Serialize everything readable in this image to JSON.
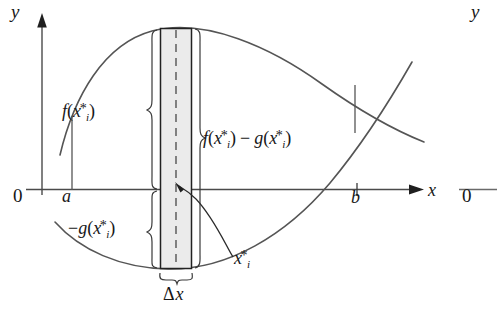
{
  "figure": {
    "colors": {
      "ink": "#1a1a1a",
      "curve": "#555555",
      "axis": "#4a4a4a",
      "rect_fill": "#ebebeb",
      "rect_stroke": "#222222",
      "brace": "#3a3a3a",
      "background": "#ffffff"
    },
    "main_plot": {
      "y_axis_label": "y",
      "x_axis_label": "x",
      "origin_label": "0",
      "left_bound_label": "a",
      "right_bound_label": "b",
      "axis_arrows": [
        "up",
        "right"
      ],
      "curves": [
        {
          "name": "upper-curve-f",
          "label": "f"
        },
        {
          "name": "lower-curve-g",
          "label": "g"
        }
      ],
      "annotations": {
        "upper_height": "f(x*ᵢ)",
        "difference": "f(x*ᵢ) − g(x*ᵢ)",
        "lower_depth": "−g(x*ᵢ)",
        "sample_point": "x*ᵢ",
        "width": "Δx"
      },
      "labels": {
        "f_x": {
          "fn": "f",
          "open": "(",
          "var": "x",
          "sub": "i",
          "star": "*",
          "close": ")"
        },
        "diff": {
          "f": "f",
          "open1": "(",
          "var1": "x",
          "sub1": "i",
          "star1": "*",
          "close1": ")",
          "minus": "−",
          "g": "g",
          "open2": "(",
          "var2": "x",
          "sub2": "i",
          "star2": "*",
          "close2": ")"
        },
        "neg_g": {
          "minus": "−",
          "fn": "g",
          "open": "(",
          "var": "x",
          "sub": "i",
          "star": "*",
          "close": ")"
        },
        "xi_star": {
          "var": "x",
          "sub": "i",
          "star": "*"
        },
        "delta_x": {
          "delta": "Δ",
          "var": "x"
        }
      }
    },
    "second_plot": {
      "y_axis_label": "y",
      "origin_label": "0"
    }
  }
}
